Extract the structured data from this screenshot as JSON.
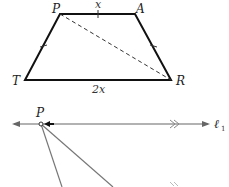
{
  "figure1": {
    "type": "trapezoid",
    "vertices": {
      "P": {
        "label": "P"
      },
      "A": {
        "label": "A"
      },
      "T": {
        "label": "T"
      },
      "R": {
        "label": "R"
      }
    },
    "top_side_label": "x",
    "bottom_side_label": "2x",
    "diagonal": "PR (dashed)",
    "tick_marks": [
      "PA",
      "PT",
      "AR"
    ]
  },
  "figure2": {
    "point_label": "P",
    "line_label": "ℓ",
    "line_subscript": "1",
    "parallel_marker": "double chevron",
    "second_line_marker": "double chevron"
  }
}
